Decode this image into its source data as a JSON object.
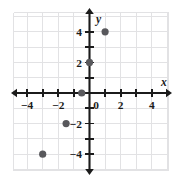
{
  "chart_data": {
    "type": "scatter",
    "title": "",
    "xlabel": "x",
    "ylabel": "y",
    "xlim": [
      -4.8,
      5.2
    ],
    "ylim": [
      -5.0,
      5.0
    ],
    "grid": true,
    "grid_step": 1,
    "legend": "none",
    "x_tick_labels": [
      {
        "value": -4,
        "text": "−4"
      },
      {
        "value": -2,
        "text": "−2"
      },
      {
        "value": 0,
        "text": "0"
      },
      {
        "value": 2,
        "text": "2"
      },
      {
        "value": 4,
        "text": "4"
      }
    ],
    "y_tick_labels": [
      {
        "value": 4,
        "text": "4"
      },
      {
        "value": 2,
        "text": "2"
      },
      {
        "value": -2,
        "text": "−2"
      },
      {
        "value": -4,
        "text": "−4"
      }
    ],
    "x_ticks": [
      -4,
      -3,
      -2,
      -1,
      1,
      2,
      3,
      4
    ],
    "y_ticks": [
      4,
      3,
      2,
      1,
      -1,
      -2,
      -3,
      -4
    ],
    "points": [
      {
        "label": "point-1",
        "x": 1,
        "y": 4
      },
      {
        "label": "point-2",
        "x": 0,
        "y": 2
      },
      {
        "label": "point-3",
        "x": -0.5,
        "y": 0
      },
      {
        "label": "point-4",
        "x": -1.5,
        "y": -2
      },
      {
        "label": "point-5",
        "x": -3,
        "y": -4
      }
    ],
    "point_color": "#58585c",
    "axis_color": "#1b1b1b",
    "grid_color": "#e2e2e4",
    "background_color": "#ffffff"
  },
  "axis_labels": {
    "x": "x",
    "y": "y"
  }
}
